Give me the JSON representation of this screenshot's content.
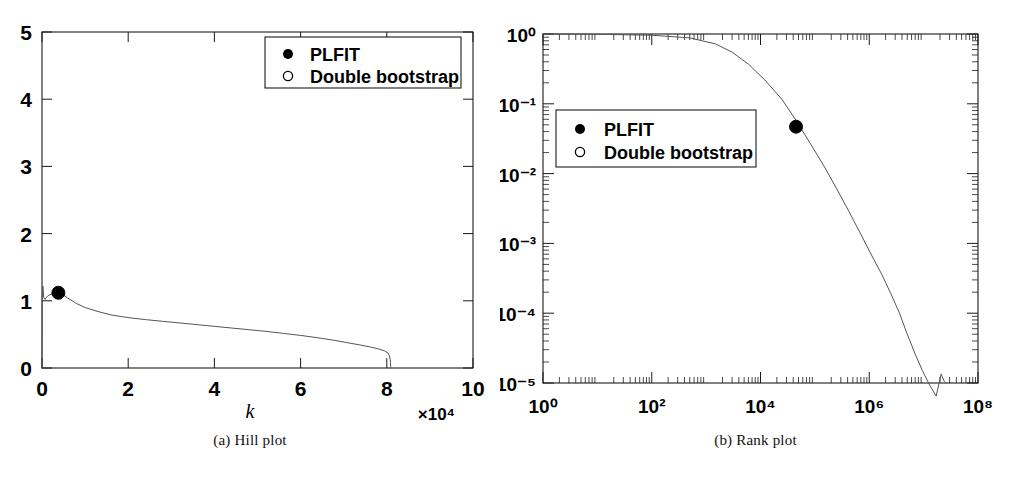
{
  "figure": {
    "background_color": "#ffffff",
    "line_color": "#555555",
    "axis_color": "#1a1a1a",
    "marker_color": "#000000"
  },
  "panels": [
    {
      "id": "a",
      "caption": "(a) Hill plot",
      "legend": {
        "entries": [
          {
            "marker": "filled-circle",
            "label": "PLFIT"
          },
          {
            "marker": "open-circle",
            "label": "Double bootstrap"
          }
        ]
      }
    },
    {
      "id": "b",
      "caption": "(b) Rank plot",
      "legend": {
        "entries": [
          {
            "marker": "filled-circle",
            "label": "PLFIT"
          },
          {
            "marker": "open-circle",
            "label": "Double bootstrap"
          }
        ]
      }
    }
  ],
  "chart_data": [
    {
      "type": "line",
      "panel": "a",
      "title": "(a) Hill plot",
      "xlabel": "k",
      "ylabel": "",
      "x_exponent_label": "×10⁴",
      "xlim": [
        0,
        100000
      ],
      "ylim": [
        0,
        5
      ],
      "xticks": [
        0,
        2,
        4,
        6,
        8,
        10
      ],
      "xtick_labels": [
        "0",
        "2",
        "4",
        "6",
        "8",
        "10"
      ],
      "yticks": [
        0,
        1,
        2,
        3,
        4,
        5
      ],
      "ytick_labels": [
        "0",
        "1",
        "2",
        "3",
        "4",
        "5"
      ],
      "xscale": "linear",
      "yscale": "linear",
      "grid": false,
      "legend_position": "top-right",
      "series": [
        {
          "name": "Hill estimator",
          "x": [
            60,
            200,
            400,
            700,
            1100,
            1800,
            2600,
            3400,
            3800,
            4600,
            6000,
            8000,
            10000,
            13000,
            16000,
            20000,
            24000,
            28000,
            32000,
            36000,
            40000,
            44000,
            48000,
            52000,
            56000,
            60000,
            64000,
            68000,
            71000,
            74000,
            76000,
            78000,
            79500,
            80300,
            80600,
            80800,
            80900
          ],
          "y": [
            1.02,
            1.22,
            1.05,
            1.02,
            1.06,
            1.09,
            1.11,
            1.12,
            1.12,
            1.1,
            1.04,
            0.96,
            0.9,
            0.84,
            0.79,
            0.75,
            0.72,
            0.695,
            0.67,
            0.645,
            0.62,
            0.595,
            0.57,
            0.545,
            0.515,
            0.485,
            0.45,
            0.41,
            0.375,
            0.34,
            0.315,
            0.285,
            0.255,
            0.22,
            0.18,
            0.12,
            0.02
          ]
        }
      ],
      "annotations": [
        {
          "name": "PLFIT",
          "marker": "filled-circle",
          "x": 3800,
          "y": 1.12
        }
      ]
    },
    {
      "type": "line",
      "panel": "b",
      "title": "(b) Rank plot",
      "xlabel": "",
      "ylabel": "",
      "xlim": [
        1,
        100000000
      ],
      "ylim": [
        1e-05,
        1
      ],
      "xscale": "log",
      "yscale": "log",
      "xticks": [
        1,
        100,
        10000,
        1000000,
        100000000
      ],
      "xtick_labels": [
        "10⁰",
        "10²",
        "10⁴",
        "10⁶",
        "10⁸"
      ],
      "yticks": [
        1,
        0.1,
        0.01,
        0.001,
        0.0001,
        1e-05
      ],
      "ytick_labels": [
        "10⁰",
        "10⁻¹",
        "10⁻²",
        "10⁻³",
        "10⁻⁴",
        "10⁻⁵"
      ],
      "grid": false,
      "legend_position": "middle-left",
      "series": [
        {
          "name": "Complementary CDF",
          "x": [
            1,
            10,
            100,
            500,
            1500,
            3000,
            6000,
            12000,
            25000,
            45000,
            80000,
            150000,
            260000,
            420000,
            700000,
            1100000,
            1700000,
            2500000,
            3600000,
            5000000,
            7000000,
            9500000,
            13000000,
            17000000,
            21000000,
            24000000,
            26000000
          ],
          "y": [
            1.0,
            0.99,
            0.96,
            0.88,
            0.72,
            0.55,
            0.37,
            0.22,
            0.115,
            0.058,
            0.028,
            0.0125,
            0.0058,
            0.0029,
            0.00135,
            0.00068,
            0.00036,
            0.00019,
            0.0001,
            5e-05,
            2.6e-05,
            1.5e-05,
            9.2e-06,
            6.5e-06,
            1.35e-05,
            1.05e-05,
            1e-05
          ]
        }
      ],
      "annotations": [
        {
          "name": "PLFIT",
          "marker": "filled-circle",
          "x": 45000,
          "y": 0.047
        }
      ]
    }
  ]
}
